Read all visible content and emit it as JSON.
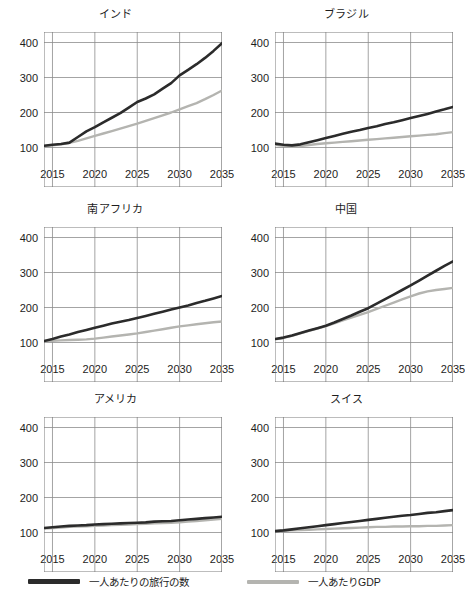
{
  "figure": {
    "panel_layout": "2 columns x 3 rows small multiples"
  },
  "legend": {
    "position": "bottom",
    "items": [
      {
        "label": "一人あたりの旅行の数",
        "color": "#2b2b2b",
        "key": "trips"
      },
      {
        "label": "一人あたりGDP",
        "color": "#b4b4b0",
        "key": "gdp"
      }
    ]
  },
  "axis": {
    "y_ticks": [
      "100",
      "200",
      "300",
      "400"
    ],
    "x_ticks": [
      "2015",
      "2020",
      "2025",
      "2030",
      "2035"
    ],
    "ylim": [
      50,
      430
    ],
    "xlim": [
      2014,
      2035
    ]
  },
  "chart_data": [
    {
      "type": "line",
      "title": "インド",
      "xlabel": "",
      "ylabel": "",
      "ylim": [
        50,
        430
      ],
      "xlim": [
        2014,
        2035
      ],
      "yticks": [
        100,
        200,
        300,
        400
      ],
      "xticks": [
        2015,
        2020,
        2025,
        2030,
        2035
      ],
      "grid": true,
      "x": [
        2014,
        2015,
        2016,
        2017,
        2018,
        2019,
        2020,
        2021,
        2022,
        2023,
        2024,
        2025,
        2026,
        2027,
        2028,
        2029,
        2030,
        2031,
        2032,
        2033,
        2034,
        2035
      ],
      "series": [
        {
          "name": "一人あたりの旅行の数",
          "color": "#2b2b2b",
          "values": [
            105,
            108,
            110,
            114,
            130,
            146,
            158,
            172,
            185,
            198,
            214,
            230,
            240,
            252,
            268,
            284,
            306,
            322,
            338,
            356,
            376,
            398
          ]
        },
        {
          "name": "一人あたりGDP",
          "color": "#b4b4b0",
          "values": [
            104,
            106,
            109,
            113,
            119,
            126,
            133,
            140,
            147,
            154,
            161,
            168,
            176,
            184,
            192,
            200,
            209,
            218,
            227,
            238,
            250,
            263
          ]
        }
      ]
    },
    {
      "type": "line",
      "title": "ブラジル",
      "xlabel": "",
      "ylabel": "",
      "ylim": [
        50,
        430
      ],
      "xlim": [
        2014,
        2035
      ],
      "yticks": [
        100,
        200,
        300,
        400
      ],
      "xticks": [
        2015,
        2020,
        2025,
        2030,
        2035
      ],
      "grid": true,
      "x": [
        2014,
        2015,
        2016,
        2017,
        2018,
        2019,
        2020,
        2021,
        2022,
        2023,
        2024,
        2025,
        2026,
        2027,
        2028,
        2029,
        2030,
        2031,
        2032,
        2033,
        2034,
        2035
      ],
      "series": [
        {
          "name": "一人あたりの旅行の数",
          "color": "#2b2b2b",
          "values": [
            111,
            108,
            106,
            109,
            115,
            121,
            127,
            133,
            139,
            145,
            150,
            156,
            161,
            167,
            172,
            178,
            184,
            190,
            196,
            203,
            209,
            216
          ]
        },
        {
          "name": "一人あたりGDP",
          "color": "#b4b4b0",
          "values": [
            108,
            105,
            103,
            104,
            107,
            110,
            112,
            114,
            116,
            118,
            120,
            122,
            124,
            126,
            128,
            130,
            132,
            134,
            136,
            138,
            141,
            144
          ]
        }
      ]
    },
    {
      "type": "line",
      "title": "南アフリカ",
      "xlabel": "",
      "ylabel": "",
      "ylim": [
        50,
        430
      ],
      "xlim": [
        2014,
        2035
      ],
      "yticks": [
        100,
        200,
        300,
        400
      ],
      "xticks": [
        2015,
        2020,
        2025,
        2030,
        2035
      ],
      "grid": true,
      "x": [
        2014,
        2015,
        2016,
        2017,
        2018,
        2019,
        2020,
        2021,
        2022,
        2023,
        2024,
        2025,
        2026,
        2027,
        2028,
        2029,
        2030,
        2031,
        2032,
        2033,
        2034,
        2035
      ],
      "series": [
        {
          "name": "一人あたりの旅行の数",
          "color": "#2b2b2b",
          "values": [
            104,
            110,
            117,
            123,
            130,
            136,
            142,
            148,
            154,
            159,
            164,
            170,
            176,
            182,
            188,
            194,
            200,
            206,
            213,
            219,
            226,
            233
          ]
        },
        {
          "name": "一人あたりGDP",
          "color": "#b4b4b0",
          "values": [
            104,
            105,
            106,
            107,
            108,
            109,
            111,
            114,
            117,
            120,
            123,
            126,
            130,
            134,
            138,
            142,
            146,
            149,
            152,
            155,
            158,
            160
          ]
        }
      ]
    },
    {
      "type": "line",
      "title": "中国",
      "xlabel": "",
      "ylabel": "",
      "ylim": [
        50,
        430
      ],
      "xlim": [
        2014,
        2035
      ],
      "yticks": [
        100,
        200,
        300,
        400
      ],
      "xticks": [
        2015,
        2020,
        2025,
        2030,
        2035
      ],
      "grid": true,
      "x": [
        2014,
        2015,
        2016,
        2017,
        2018,
        2019,
        2020,
        2021,
        2022,
        2023,
        2024,
        2025,
        2026,
        2027,
        2028,
        2029,
        2030,
        2031,
        2032,
        2033,
        2034,
        2035
      ],
      "series": [
        {
          "name": "一人あたりの旅行の数",
          "color": "#2b2b2b",
          "values": [
            110,
            114,
            120,
            127,
            134,
            141,
            148,
            157,
            167,
            177,
            188,
            198,
            211,
            224,
            237,
            250,
            263,
            277,
            291,
            305,
            319,
            332
          ]
        },
        {
          "name": "一人あたりGDP",
          "color": "#b4b4b0",
          "values": [
            109,
            113,
            119,
            126,
            133,
            140,
            147,
            155,
            163,
            171,
            179,
            187,
            196,
            205,
            214,
            223,
            232,
            240,
            246,
            250,
            253,
            256
          ]
        }
      ]
    },
    {
      "type": "line",
      "title": "アメリカ",
      "xlabel": "",
      "ylabel": "",
      "ylim": [
        50,
        430
      ],
      "xlim": [
        2014,
        2035
      ],
      "yticks": [
        100,
        200,
        300,
        400
      ],
      "xticks": [
        2015,
        2020,
        2025,
        2030,
        2035
      ],
      "grid": true,
      "x": [
        2014,
        2015,
        2016,
        2017,
        2018,
        2019,
        2020,
        2021,
        2022,
        2023,
        2024,
        2025,
        2026,
        2027,
        2028,
        2029,
        2030,
        2031,
        2032,
        2033,
        2034,
        2035
      ],
      "series": [
        {
          "name": "一人あたりの旅行の数",
          "color": "#2b2b2b",
          "values": [
            113,
            115,
            117,
            119,
            120,
            121,
            123,
            124,
            125,
            126,
            127,
            128,
            129,
            131,
            132,
            133,
            135,
            137,
            139,
            141,
            143,
            145
          ]
        },
        {
          "name": "一人あたりGDP",
          "color": "#b4b4b0",
          "values": [
            111,
            113,
            114,
            116,
            117,
            118,
            119,
            120,
            121,
            122,
            123,
            124,
            125,
            126,
            127,
            128,
            129,
            131,
            133,
            135,
            137,
            139
          ]
        }
      ]
    },
    {
      "type": "line",
      "title": "スイス",
      "xlabel": "",
      "ylabel": "",
      "ylim": [
        50,
        430
      ],
      "xlim": [
        2014,
        2035
      ],
      "yticks": [
        100,
        200,
        300,
        400
      ],
      "xticks": [
        2015,
        2020,
        2025,
        2030,
        2035
      ],
      "grid": true,
      "x": [
        2014,
        2015,
        2016,
        2017,
        2018,
        2019,
        2020,
        2021,
        2022,
        2023,
        2024,
        2025,
        2026,
        2027,
        2028,
        2029,
        2030,
        2031,
        2032,
        2033,
        2034,
        2035
      ],
      "series": [
        {
          "name": "一人あたりの旅行の数",
          "color": "#2b2b2b",
          "values": [
            104,
            106,
            109,
            112,
            115,
            118,
            121,
            124,
            127,
            130,
            133,
            136,
            139,
            142,
            145,
            148,
            150,
            153,
            156,
            158,
            161,
            164
          ]
        },
        {
          "name": "一人あたりGDP",
          "color": "#b4b4b0",
          "values": [
            104,
            105,
            106,
            107,
            108,
            109,
            110,
            111,
            112,
            113,
            114,
            115,
            116,
            116,
            117,
            117,
            118,
            118,
            119,
            119,
            120,
            121
          ]
        }
      ]
    }
  ]
}
